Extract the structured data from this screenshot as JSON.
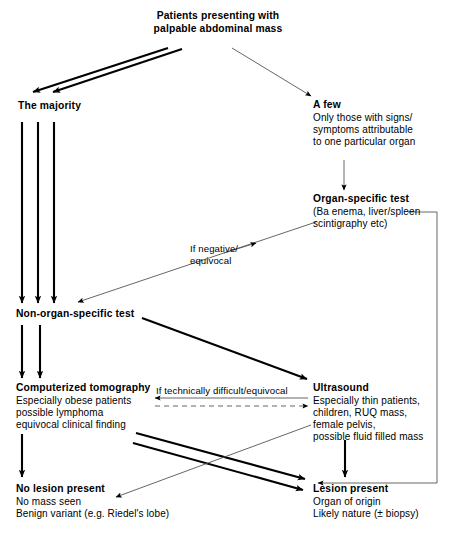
{
  "diagram": {
    "nodes": {
      "root": {
        "line1": "Patients presenting with",
        "line2": "palpable abdominal mass"
      },
      "majority": {
        "title": "The majority"
      },
      "afew": {
        "title": "A few",
        "sub1": "Only those with signs/",
        "sub2": "symptoms attributable",
        "sub3": "to one particular organ"
      },
      "organ_specific": {
        "title": "Organ-specific test",
        "sub1": "(Ba enema, liver/spleen",
        "sub2": "scintigraphy etc)"
      },
      "non_organ_specific": {
        "title": "Non-organ-specific test"
      },
      "ct": {
        "title": "Computerized tomography",
        "sub1": "Especially obese patients",
        "sub2": "possible lymphoma",
        "sub3": "equivocal clinical finding"
      },
      "ultrasound": {
        "title": "Ultrasound",
        "sub1": "Especially thin patients,",
        "sub2": "children, RUQ mass,",
        "sub3": "female pelvis,",
        "sub4": "possible fluid filled mass"
      },
      "no_lesion": {
        "title": "No lesion present",
        "sub1": "No mass seen",
        "sub2": "Benign variant (e.g. Riedel's lobe)"
      },
      "lesion": {
        "title": "Lesion present",
        "sub1": "Organ of origin",
        "sub2": "Likely nature (± biopsy)"
      }
    },
    "edge_labels": {
      "negative_equivocal": {
        "line1": "If negative/",
        "line2": "equivocal"
      },
      "technically_difficult": "If technically difficult/equivocal"
    },
    "colors": {
      "ink": "#000000",
      "background": "#ffffff",
      "thin_stroke": "#555555"
    }
  }
}
